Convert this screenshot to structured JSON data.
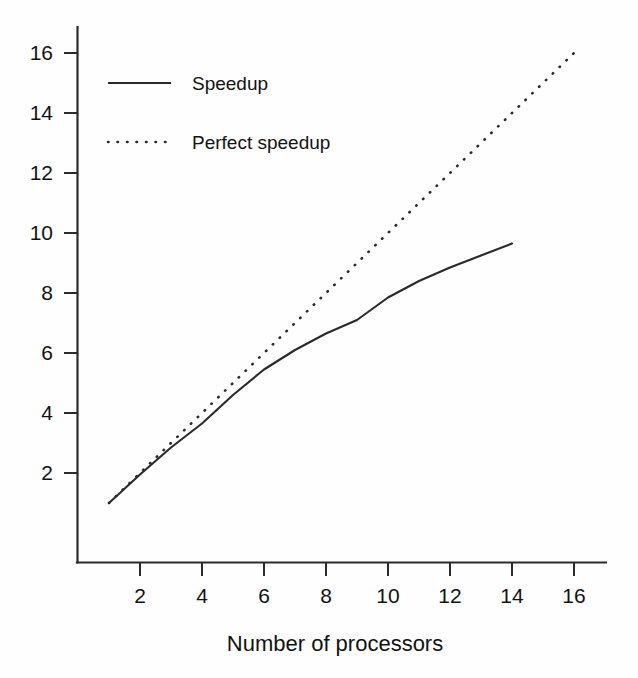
{
  "chart_data": {
    "type": "line",
    "title": "",
    "xlabel": "Number of processors",
    "ylabel": "",
    "xlim": [
      0,
      17
    ],
    "ylim": [
      0,
      17
    ],
    "xticks": [
      2,
      4,
      6,
      8,
      10,
      12,
      14,
      16
    ],
    "yticks": [
      2,
      4,
      6,
      8,
      10,
      12,
      14,
      16
    ],
    "xtick_labels": [
      "2",
      "4",
      "6",
      "8",
      "10",
      "12",
      "14",
      "16"
    ],
    "ytick_labels": [
      "2",
      "4",
      "6",
      "8",
      "10",
      "12",
      "14",
      "16"
    ],
    "grid": false,
    "legend_position": "upper left inside",
    "line_color": "#2a2a2a",
    "background_color": "#fefefe",
    "series": [
      {
        "name": "Speedup",
        "style": "solid",
        "x": [
          1,
          2,
          3,
          4,
          5,
          6,
          7,
          8,
          9,
          10,
          11,
          12,
          13,
          14
        ],
        "values": [
          1.0,
          1.95,
          2.85,
          3.65,
          4.6,
          5.45,
          6.1,
          6.65,
          7.1,
          7.85,
          8.4,
          8.85,
          9.25,
          9.65
        ]
      },
      {
        "name": "Perfect speedup",
        "style": "dotted",
        "x": [
          1,
          16
        ],
        "values": [
          1,
          16
        ]
      }
    ]
  },
  "legend": {
    "entries": [
      {
        "label": "Speedup",
        "style": "solid"
      },
      {
        "label": "Perfect speedup",
        "style": "dotted"
      }
    ]
  },
  "axes": {
    "x_title": "Number of processors"
  }
}
